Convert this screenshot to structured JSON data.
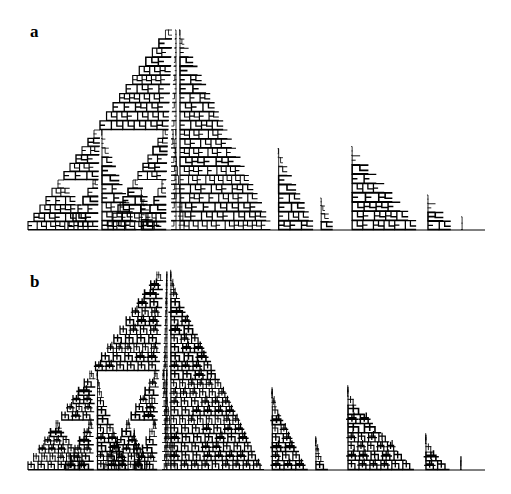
{
  "figure": {
    "panels": [
      {
        "id": "a",
        "label": "a",
        "description": "Fractal tiling of a right-skewed triangle by quadrilateral cells (rectangular pattern)",
        "triangle": {
          "apex": [
            172,
            30
          ],
          "base_left": [
            28,
            230
          ],
          "base_right": [
            485,
            230
          ]
        },
        "style": "boxes",
        "depth": 4,
        "stroke_color": "#000000"
      },
      {
        "id": "b",
        "label": "b",
        "description": "Fractal tiling of a triangle with cross/serpentine cell pattern",
        "triangle": {
          "apex": [
            163,
            27
          ],
          "base_left": [
            28,
            225
          ],
          "base_right": [
            485,
            225
          ]
        },
        "style": "crosses",
        "depth": 4,
        "stroke_color": "#000000"
      }
    ],
    "footer_text": ""
  }
}
